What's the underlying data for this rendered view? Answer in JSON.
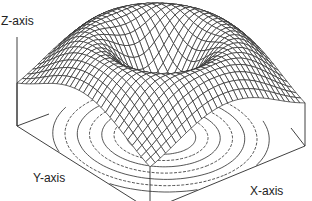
{
  "chart_data": {
    "type": "surface",
    "title": "",
    "xlabel": "X-axis",
    "ylabel": "Y-axis",
    "zlabel": "Z-axis",
    "function": "z = r^2 * exp(-r^2) style radial ring; peak ring around radius ~1, dip at center",
    "grid_lines": 30,
    "contour_levels": 7,
    "ticks": "none",
    "grid": false,
    "legend": "none"
  },
  "colors": {
    "line": "#2a2a2a",
    "background": "#ffffff"
  }
}
